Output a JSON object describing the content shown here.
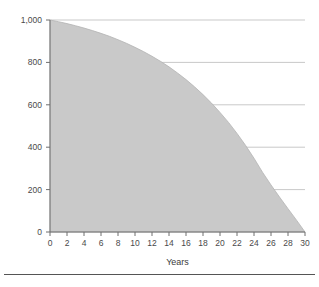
{
  "chart_data": {
    "type": "area",
    "title": "",
    "subtitle": "",
    "xlabel": "Years",
    "ylabel": "",
    "xlim": [
      0,
      30
    ],
    "ylim": [
      0,
      1000
    ],
    "grid": true,
    "legend": null,
    "legend_position": "none",
    "fill_color": "#c9c9c9",
    "line_color": "#b4b4b4",
    "grid_color": "#c9c9c9",
    "axis_color": "#6e6e6e",
    "tick_label_color": "#4a4a4a",
    "xticks": [
      0,
      2,
      4,
      6,
      8,
      10,
      12,
      14,
      16,
      18,
      20,
      22,
      24,
      26,
      28,
      30
    ],
    "xtick_labels": [
      "0",
      "2",
      "4",
      "6",
      "8",
      "10",
      "12",
      "14",
      "16",
      "18",
      "20",
      "22",
      "24",
      "26",
      "28",
      "30"
    ],
    "yticks": [
      0,
      200,
      400,
      600,
      800,
      1000
    ],
    "ytick_labels": [
      "0",
      "200",
      "400",
      "600",
      "800",
      "1,000"
    ],
    "x": [
      0,
      1,
      2,
      3,
      4,
      5,
      6,
      7,
      8,
      9,
      10,
      11,
      12,
      13,
      14,
      15,
      16,
      17,
      18,
      19,
      20,
      21,
      22,
      23,
      24,
      25,
      26,
      27,
      28,
      29,
      30
    ],
    "values": [
      1000,
      992,
      983,
      973,
      962,
      950,
      937,
      923,
      907,
      890,
      871,
      851,
      829,
      805,
      779,
      750,
      719,
      685,
      648,
      608,
      564,
      517,
      465,
      409,
      348,
      282,
      222,
      165,
      110,
      56,
      0
    ],
    "series": [
      {
        "name": "Remaining balance",
        "values": [
          1000,
          992,
          983,
          973,
          962,
          950,
          937,
          923,
          907,
          890,
          871,
          851,
          829,
          805,
          779,
          750,
          719,
          685,
          648,
          608,
          564,
          517,
          465,
          409,
          348,
          282,
          222,
          165,
          110,
          56,
          0
        ]
      }
    ]
  },
  "footer": {
    "rule_visible": true
  }
}
